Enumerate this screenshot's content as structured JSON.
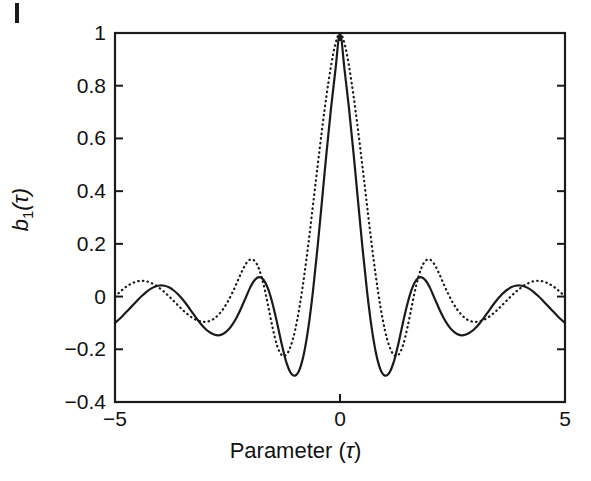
{
  "figure": {
    "background_color": "#ffffff",
    "axis_color": "#1a1a1a",
    "corner_mark": "register-mark"
  },
  "axes": {
    "x_label_prefix": "Parameter (",
    "x_label_symbol": "τ",
    "x_label_suffix": ")",
    "x_label_full": "Parameter (τ)",
    "y_label_base": "b",
    "y_label_sub": "1",
    "y_label_arg": "(τ)",
    "y_label_full": "b₁(τ)",
    "x_ticks": [
      "−5",
      "0",
      "5"
    ],
    "x_tick_values": [
      -5,
      0,
      5
    ],
    "y_ticks": [
      "1",
      "0.8",
      "0.6",
      "0.4",
      "0.2",
      "0",
      "−0.2",
      "−0.4"
    ],
    "y_tick_values": [
      1,
      0.8,
      0.6,
      0.4,
      0.2,
      0,
      -0.2,
      -0.4
    ]
  },
  "chart_data": {
    "type": "line",
    "title": "",
    "xlabel": "Parameter (τ)",
    "ylabel": "b₁(τ)",
    "xlim": [
      -5,
      5
    ],
    "ylim": [
      -0.4,
      1
    ],
    "grid": false,
    "legend": null,
    "x_ticks": [
      -5,
      0,
      5
    ],
    "y_ticks": [
      1,
      0.8,
      0.6,
      0.4,
      0.2,
      0,
      -0.2,
      -0.4
    ],
    "series": [
      {
        "name": "solid-curve",
        "style": "solid",
        "color": "#1a1a1a",
        "width": 2.2,
        "x": [
          -5,
          -4.9,
          -4.8,
          -4.7,
          -4.6,
          -4.5,
          -4.4,
          -4.3,
          -4.2,
          -4.1,
          -4,
          -3.9,
          -3.8,
          -3.7,
          -3.6,
          -3.5,
          -3.4,
          -3.3,
          -3.2,
          -3.1,
          -3,
          -2.9,
          -2.8,
          -2.7,
          -2.6,
          -2.5,
          -2.4,
          -2.3,
          -2.2,
          -2.1,
          -2,
          -1.9,
          -1.8,
          -1.7,
          -1.6,
          -1.5,
          -1.4,
          -1.3,
          -1.2,
          -1.1,
          -1,
          -0.9,
          -0.8,
          -0.7,
          -0.6,
          -0.5,
          -0.4,
          -0.3,
          -0.2,
          -0.1,
          0,
          0.1,
          0.2,
          0.3,
          0.4,
          0.5,
          0.6,
          0.7,
          0.8,
          0.9,
          1,
          1.1,
          1.2,
          1.3,
          1.4,
          1.5,
          1.6,
          1.7,
          1.8,
          1.9,
          2,
          2.1,
          2.2,
          2.3,
          2.4,
          2.5,
          2.6,
          2.7,
          2.8,
          2.9,
          3,
          3.1,
          3.2,
          3.3,
          3.4,
          3.5,
          3.6,
          3.7,
          3.8,
          3.9,
          4,
          4.1,
          4.2,
          4.3,
          4.4,
          4.5,
          4.6,
          4.7,
          4.8,
          4.9,
          5
        ],
        "y": [
          -0.1,
          -0.085,
          -0.068,
          -0.05,
          -0.032,
          -0.014,
          0.003,
          0.018,
          0.03,
          0.038,
          0.042,
          0.041,
          0.035,
          0.024,
          0.009,
          -0.01,
          -0.032,
          -0.056,
          -0.08,
          -0.102,
          -0.121,
          -0.135,
          -0.144,
          -0.147,
          -0.142,
          -0.129,
          -0.108,
          -0.08,
          -0.045,
          -0.006,
          0.033,
          0.062,
          0.074,
          0.064,
          0.03,
          -0.026,
          -0.098,
          -0.177,
          -0.245,
          -0.288,
          -0.3,
          -0.277,
          -0.215,
          -0.114,
          0.022,
          0.185,
          0.364,
          0.545,
          0.714,
          0.862,
          1.0,
          0.862,
          0.714,
          0.545,
          0.364,
          0.185,
          0.022,
          -0.114,
          -0.215,
          -0.277,
          -0.3,
          -0.288,
          -0.245,
          -0.177,
          -0.098,
          -0.026,
          0.03,
          0.064,
          0.074,
          0.062,
          0.033,
          -0.006,
          -0.045,
          -0.08,
          -0.108,
          -0.129,
          -0.142,
          -0.147,
          -0.144,
          -0.135,
          -0.121,
          -0.102,
          -0.08,
          -0.056,
          -0.032,
          -0.01,
          0.009,
          0.024,
          0.035,
          0.041,
          0.042,
          0.038,
          0.03,
          0.018,
          0.003,
          -0.014,
          -0.032,
          -0.05,
          -0.068,
          -0.085,
          -0.1
        ]
      },
      {
        "name": "dotted-curve",
        "style": "dotted",
        "color": "#1a1a1a",
        "width": 2.2,
        "x": [
          -5,
          -4.9,
          -4.8,
          -4.7,
          -4.6,
          -4.5,
          -4.4,
          -4.3,
          -4.2,
          -4.1,
          -4,
          -3.9,
          -3.8,
          -3.7,
          -3.6,
          -3.5,
          -3.4,
          -3.3,
          -3.2,
          -3.1,
          -3,
          -2.9,
          -2.8,
          -2.7,
          -2.6,
          -2.5,
          -2.4,
          -2.3,
          -2.2,
          -2.1,
          -2,
          -1.9,
          -1.8,
          -1.7,
          -1.6,
          -1.5,
          -1.4,
          -1.3,
          -1.2,
          -1.1,
          -1,
          -0.9,
          -0.8,
          -0.7,
          -0.6,
          -0.5,
          -0.4,
          -0.3,
          -0.2,
          -0.1,
          0,
          0.1,
          0.2,
          0.3,
          0.4,
          0.5,
          0.6,
          0.7,
          0.8,
          0.9,
          1,
          1.1,
          1.2,
          1.3,
          1.4,
          1.5,
          1.6,
          1.7,
          1.8,
          1.9,
          2,
          2.1,
          2.2,
          2.3,
          2.4,
          2.5,
          2.6,
          2.7,
          2.8,
          2.9,
          3,
          3.1,
          3.2,
          3.3,
          3.4,
          3.5,
          3.6,
          3.7,
          3.8,
          3.9,
          4,
          4.1,
          4.2,
          4.3,
          4.4,
          4.5,
          4.6,
          4.7,
          4.8,
          4.9,
          5
        ],
        "y": [
          0.0,
          0.016,
          0.031,
          0.043,
          0.052,
          0.058,
          0.06,
          0.058,
          0.052,
          0.043,
          0.031,
          0.017,
          0.001,
          -0.016,
          -0.033,
          -0.05,
          -0.065,
          -0.078,
          -0.088,
          -0.094,
          -0.096,
          -0.093,
          -0.084,
          -0.069,
          -0.048,
          -0.021,
          0.012,
          0.049,
          0.088,
          0.122,
          0.14,
          0.136,
          0.105,
          0.047,
          -0.032,
          -0.116,
          -0.185,
          -0.221,
          -0.222,
          -0.19,
          -0.129,
          -0.04,
          0.073,
          0.204,
          0.347,
          0.492,
          0.633,
          0.762,
          0.875,
          0.96,
          1.0,
          0.96,
          0.875,
          0.762,
          0.633,
          0.492,
          0.347,
          0.204,
          0.073,
          -0.04,
          -0.129,
          -0.19,
          -0.222,
          -0.221,
          -0.185,
          -0.116,
          -0.032,
          0.047,
          0.105,
          0.136,
          0.14,
          0.122,
          0.088,
          0.049,
          0.012,
          -0.021,
          -0.048,
          -0.069,
          -0.084,
          -0.093,
          -0.096,
          -0.094,
          -0.088,
          -0.078,
          -0.065,
          -0.05,
          -0.033,
          -0.016,
          0.001,
          0.017,
          0.031,
          0.043,
          0.052,
          0.058,
          0.06,
          0.058,
          0.052,
          0.043,
          0.031,
          0.016,
          0.0
        ]
      }
    ],
    "annotations": {
      "main_lobe_peak": 1.0,
      "main_lobe_peak_x": 0,
      "solid_min": -0.3,
      "dotted_min": -0.222
    }
  }
}
